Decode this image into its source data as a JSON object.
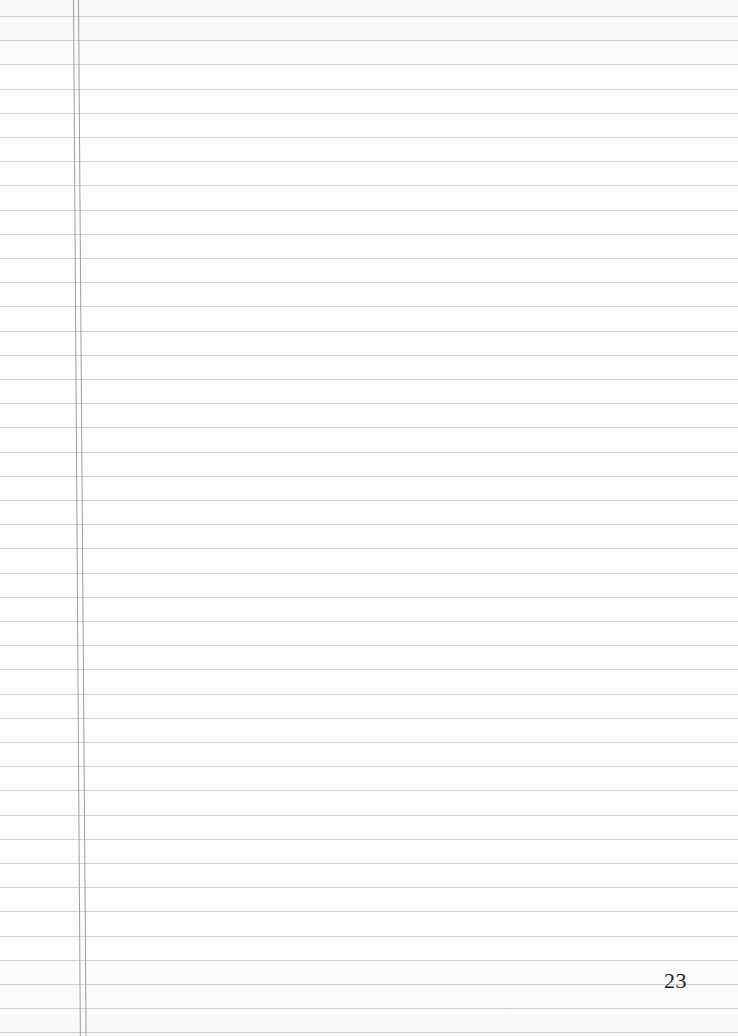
{
  "page": {
    "type": "lined-notebook-page",
    "page_number": "23",
    "line_count": 43,
    "line_spacing_px": 24.2,
    "first_line_y": 16,
    "margin_lines_x": [
      73,
      78
    ],
    "colors": {
      "paper": "#fcfcfc",
      "rule_line": "#c9c9c9",
      "margin_line": "#9e9e9e",
      "text": "#222222"
    }
  }
}
